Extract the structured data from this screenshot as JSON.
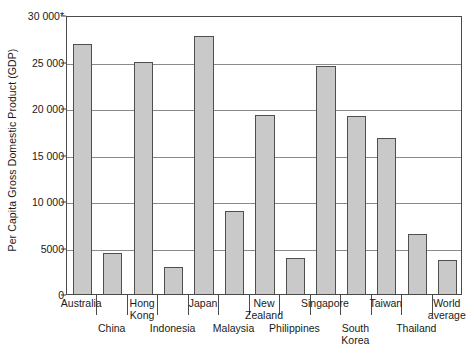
{
  "chart_data": {
    "type": "bar",
    "title": "",
    "subtitle": "",
    "xlabel": "",
    "ylabel": "Per Capita Gross Domestic Product (GDP)",
    "ylim": [
      0,
      30000
    ],
    "grid": true,
    "legend": null,
    "y_ticks": [
      {
        "value": 0,
        "label": "0"
      },
      {
        "value": 5000,
        "label": "5000"
      },
      {
        "value": 10000,
        "label": "10 000"
      },
      {
        "value": 15000,
        "label": "15 000"
      },
      {
        "value": 20000,
        "label": "20 000"
      },
      {
        "value": 25000,
        "label": "25 000"
      },
      {
        "value": 30000,
        "label": "30 000*"
      }
    ],
    "categories": [
      "Australia",
      "China",
      "Hong Kong",
      "Indonesia",
      "Japan",
      "Malaysia",
      "New Zealand",
      "Philippines",
      "Singapore",
      "South Korea",
      "Taiwan",
      "Thailand",
      "World average"
    ],
    "values": [
      26900,
      4400,
      25000,
      2900,
      27700,
      8900,
      19300,
      3900,
      24500,
      19100,
      16800,
      6400,
      3700
    ],
    "bars": [
      {
        "category": "Australia",
        "label_line1": "Australia",
        "label_line2": "",
        "row": "top",
        "value": 26900
      },
      {
        "category": "China",
        "label_line1": "China",
        "label_line2": "",
        "row": "bottom",
        "value": 4400
      },
      {
        "category": "Hong Kong",
        "label_line1": "Hong",
        "label_line2": "Kong",
        "row": "top",
        "value": 25000
      },
      {
        "category": "Indonesia",
        "label_line1": "Indonesia",
        "label_line2": "",
        "row": "bottom",
        "value": 2900
      },
      {
        "category": "Japan",
        "label_line1": "Japan",
        "label_line2": "",
        "row": "top",
        "value": 27700
      },
      {
        "category": "Malaysia",
        "label_line1": "Malaysia",
        "label_line2": "",
        "row": "bottom",
        "value": 8900
      },
      {
        "category": "New Zealand",
        "label_line1": "New",
        "label_line2": "Zealand",
        "row": "top",
        "value": 19300
      },
      {
        "category": "Philippines",
        "label_line1": "Philippines",
        "label_line2": "",
        "row": "bottom",
        "value": 3900
      },
      {
        "category": "Singapore",
        "label_line1": "Singapore",
        "label_line2": "",
        "row": "top",
        "value": 24500
      },
      {
        "category": "South Korea",
        "label_line1": "South",
        "label_line2": "Korea",
        "row": "bottom",
        "value": 19100
      },
      {
        "category": "Taiwan",
        "label_line1": "Taiwan",
        "label_line2": "",
        "row": "top",
        "value": 16800
      },
      {
        "category": "Thailand",
        "label_line1": "Thailand",
        "label_line2": "",
        "row": "bottom",
        "value": 6400
      },
      {
        "category": "World average",
        "label_line1": "World",
        "label_line2": "average",
        "row": "top",
        "value": 3700
      }
    ],
    "colors": {
      "bar_fill": "#c9c9c9",
      "bar_border": "#4f4f4f",
      "gridline": "#8a8a8a",
      "axis": "#4a4a4a",
      "text": "#1a1a1a",
      "background": "#ffffff"
    }
  }
}
